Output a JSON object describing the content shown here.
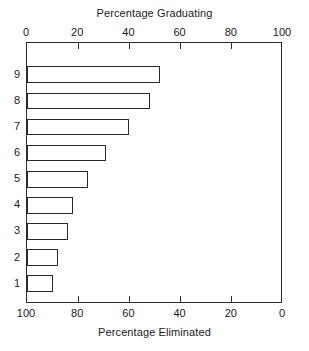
{
  "chart_data": {
    "type": "bar",
    "orientation": "horizontal",
    "title": "",
    "top_axis": {
      "label": "Percentage Graduating",
      "ticks": [
        0,
        20,
        40,
        60,
        80,
        100
      ],
      "range": [
        0,
        100
      ],
      "reversed": false
    },
    "bottom_axis": {
      "label": "Percentage Eliminated",
      "ticks": [
        100,
        80,
        60,
        40,
        20,
        0
      ],
      "range": [
        0,
        100
      ],
      "reversed": true
    },
    "ylabel": "",
    "categories": [
      "1",
      "2",
      "3",
      "4",
      "5",
      "6",
      "7",
      "8",
      "9"
    ],
    "values": [
      10,
      12,
      16,
      18,
      24,
      31,
      40,
      48,
      52
    ],
    "series": [
      {
        "name": "Percentage Graduating",
        "values": [
          10,
          12,
          16,
          18,
          24,
          31,
          40,
          48,
          52
        ]
      }
    ],
    "grid": false,
    "legend": null,
    "bar_fill": "#ffffff",
    "bar_stroke": "#2b2b2b",
    "axis_color": "#2b2b2b"
  }
}
